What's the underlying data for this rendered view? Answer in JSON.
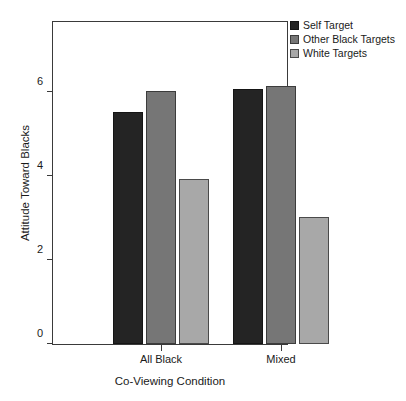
{
  "chart_data": {
    "type": "bar",
    "title": "",
    "subtitle": "",
    "xlabel": "Co-Viewing Condition",
    "ylabel": "Attitude Toward Blacks",
    "categories": [
      "All Black",
      "Mixed"
    ],
    "series": [
      {
        "name": "Self Target",
        "color": "#242424",
        "values": [
          5.51,
          6.07
        ]
      },
      {
        "name": "Other Black Targets",
        "color": "#767676",
        "values": [
          6.02,
          6.14
        ]
      },
      {
        "name": "White Targets",
        "color": "#a8a8a8",
        "values": [
          3.93,
          3.02
        ]
      }
    ],
    "ylim": [
      0,
      7.7
    ],
    "yticks": [
      0,
      2,
      4,
      6
    ],
    "ytick_labels": [
      "0",
      "2",
      "4",
      "6"
    ],
    "grid": false,
    "legend_position": "top-right-outside",
    "frame": true
  },
  "legend": {
    "entries": [
      {
        "label": "Self Target",
        "color": "#242424"
      },
      {
        "label": "Other Black Targets",
        "color": "#767676"
      },
      {
        "label": "White Targets",
        "color": "#a8a8a8"
      }
    ]
  },
  "axes": {
    "x_title": "Co-Viewing Condition",
    "y_title": "Attitude Toward Blacks"
  }
}
